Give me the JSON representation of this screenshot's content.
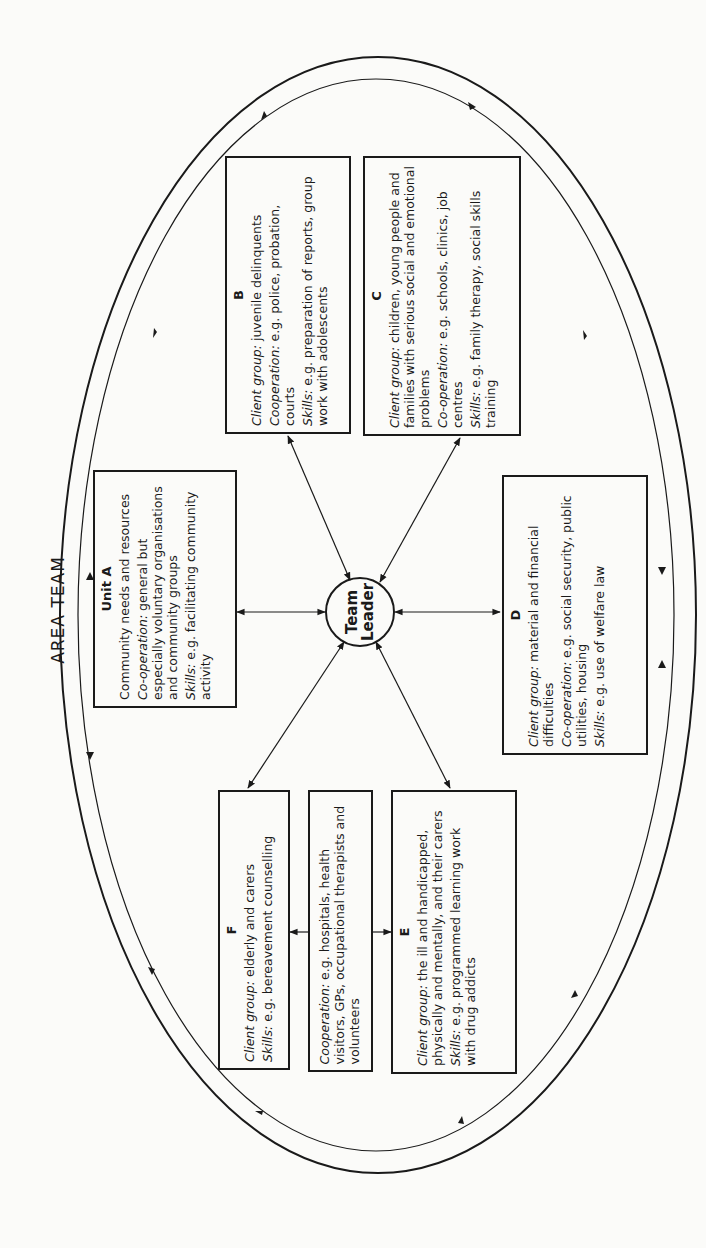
{
  "diagram": {
    "title": "AREA TEAM",
    "center": {
      "label_line1": "Team",
      "label_line2": "Leader"
    },
    "units": {
      "A": {
        "title": "Unit A",
        "focus": "Community needs and resources",
        "cooperation_label": "Co-operation:",
        "cooperation": "general but especially voluntary organisations and community groups",
        "skills_label": "Skills:",
        "skills": "e.g. facilitating community activity"
      },
      "B": {
        "title": "B",
        "client_label": "Client group:",
        "client": "juvenile delinquents",
        "cooperation_label": "Cooperation:",
        "cooperation": "e.g. police, probation, courts",
        "skills_label": "Skills:",
        "skills": "e.g. preparation of reports, group work with adolescents"
      },
      "C": {
        "title": "C",
        "client_label": "Client group:",
        "client": "children, young people and families with serious social and emotional problems",
        "cooperation_label": "Co-operation:",
        "cooperation": "e.g. schools, clinics, job centres",
        "skills_label": "Skills:",
        "skills": "e.g. family therapy, social skills training"
      },
      "D": {
        "title": "D",
        "client_label": "Client group:",
        "client": "material and financial difficulties",
        "cooperation_label": "Co-operation:",
        "cooperation": "e.g. social security, public utilities, housing",
        "skills_label": "Skills:",
        "skills": "e.g. use of welfare law"
      },
      "E": {
        "title": "E",
        "client_label": "Client group:",
        "client": "the ill and handicapped, physically and mentally, and their carers",
        "skills_label": "Skills:",
        "skills": "e.g. programmed learning work with drug addicts"
      },
      "F": {
        "title": "F",
        "client_label": "Client group:",
        "client": "elderly and carers",
        "skills_label": "Skills:",
        "skills": "e.g. bereavement counselling"
      },
      "EF_shared": {
        "cooperation_label": "Cooperation:",
        "cooperation": "e.g. hospitals, health visitors, GPs, occupational therapists and volunteers"
      }
    },
    "colors": {
      "ink": "#1a1a1a",
      "paper": "#fbfbf9"
    }
  }
}
